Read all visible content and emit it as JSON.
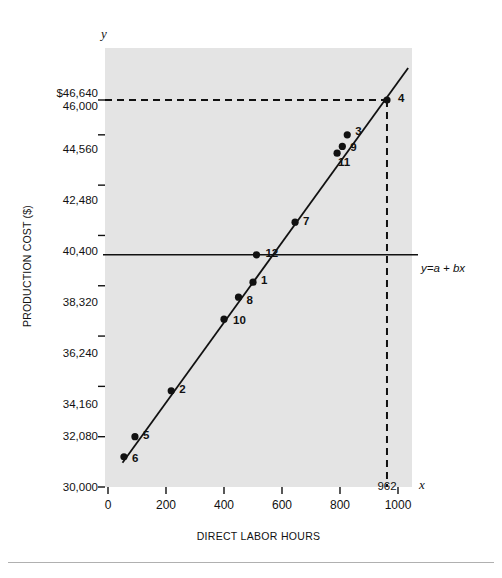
{
  "figure": {
    "background_color": "#ffffff",
    "plot_background_color": "#e4e4e4",
    "line_color": "#111111",
    "point_color": "#111111"
  },
  "axis_markers": {
    "y": "y",
    "x": "x"
  },
  "annotations": {
    "regression_equation": "y=a + bx",
    "x_intercept_note": "962"
  },
  "chart_data": {
    "type": "scatter",
    "title": "",
    "xlabel": "DIRECT LABOR  HOURS",
    "ylabel": "PRODUCTION COST ($)",
    "xlim": [
      0,
      1060
    ],
    "ylim": [
      30000,
      47800
    ],
    "xticks": [
      0,
      200,
      400,
      600,
      800,
      1000
    ],
    "xticklabels": [
      "0",
      "200",
      "400",
      "600",
      "800",
      "1000"
    ],
    "yticks": [
      30000,
      32080,
      34160,
      36240,
      38320,
      40400,
      42480,
      44560,
      46000,
      46640
    ],
    "yticklabels": [
      "30,000",
      "32,080",
      "34,160",
      "36,240",
      "38,320",
      "40,400",
      "42,480",
      "44,560",
      "46,000",
      "$46,640"
    ],
    "grid": false,
    "legend": false,
    "points": [
      {
        "label": "6",
        "x": 55,
        "y": 31250
      },
      {
        "label": "5",
        "x": 93,
        "y": 32080
      },
      {
        "label": "2",
        "x": 218,
        "y": 33980
      },
      {
        "label": "10",
        "x": 400,
        "y": 36940
      },
      {
        "label": "8",
        "x": 450,
        "y": 37850
      },
      {
        "label": "1",
        "x": 500,
        "y": 38470
      },
      {
        "label": "12",
        "x": 512,
        "y": 39600
      },
      {
        "label": "7",
        "x": 645,
        "y": 40950
      },
      {
        "label": "11",
        "x": 790,
        "y": 43800
      },
      {
        "label": "9",
        "x": 808,
        "y": 44080
      },
      {
        "label": "3",
        "x": 825,
        "y": 44560
      },
      {
        "label": "4",
        "x": 962,
        "y": 46000
      }
    ],
    "fit_line": {
      "name": "y=a + bx",
      "x_start": 50,
      "y_start": 31000,
      "x_end": 1035,
      "y_end": 47320
    },
    "reference_lines": [
      {
        "name": "intercept-level",
        "orientation": "horizontal",
        "value": 39600,
        "style": "solid"
      },
      {
        "name": "predicted-cost",
        "orientation": "horizontal",
        "value": 46000,
        "style": "dashed"
      },
      {
        "name": "predicted-hours",
        "orientation": "vertical",
        "value": 962,
        "style": "dashed"
      }
    ]
  }
}
